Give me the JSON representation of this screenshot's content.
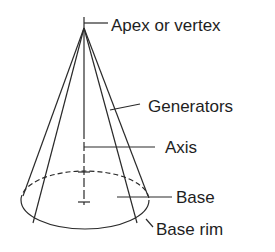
{
  "diagram": {
    "labels": {
      "apex": "Apex or vertex",
      "generators": "Generators",
      "axis": "Axis",
      "base": "Base",
      "base_rim": "Base rim"
    },
    "colors": {
      "stroke": "#2a2a2a",
      "text": "#1e1e1e",
      "background": "#ffffff"
    }
  }
}
